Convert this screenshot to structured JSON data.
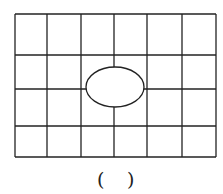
{
  "figure": {
    "grid": {
      "columns": 6,
      "rows": 4,
      "x_lines": [
        15,
        47,
        81,
        114,
        147,
        182,
        216
      ],
      "y_lines": [
        14,
        55,
        89,
        126,
        157
      ],
      "stroke": "#222222"
    },
    "ellipse": {
      "cx": 115,
      "cy": 87,
      "rx": 29,
      "ry": 20,
      "fill": "#ffffff",
      "stroke": "#222222"
    }
  },
  "answer_blank": {
    "open": "(",
    "close": ")"
  }
}
